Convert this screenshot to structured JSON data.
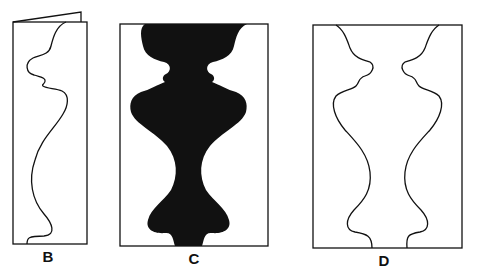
{
  "figure": {
    "panels": [
      {
        "id": "B",
        "label": "B",
        "style": "outline single profile on folded card"
      },
      {
        "id": "C",
        "label": "C",
        "style": "solid black vase silhouette"
      },
      {
        "id": "D",
        "label": "D",
        "style": "outline two facing profiles"
      }
    ]
  },
  "colors": {
    "ink": "#111111",
    "background": "#ffffff"
  }
}
